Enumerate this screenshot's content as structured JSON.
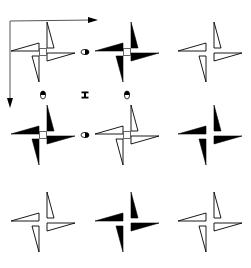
{
  "diagram": {
    "type": "symmetry-pattern",
    "colors": {
      "ink": "#000000",
      "background": "#ffffff",
      "axis": "#555555"
    },
    "axes": {
      "origin": [
        10,
        21
      ],
      "x_end": [
        98,
        20
      ],
      "y_end": [
        10,
        108
      ]
    },
    "pinwheels": [
      {
        "row": 0,
        "col": 0,
        "cx": 43,
        "cy": 52,
        "style": "outline",
        "center_square": true
      },
      {
        "row": 0,
        "col": 1,
        "cx": 127,
        "cy": 52,
        "style": "filled",
        "center_square": true
      },
      {
        "row": 0,
        "col": 2,
        "cx": 210,
        "cy": 52,
        "style": "outline",
        "center_square": false
      },
      {
        "row": 1,
        "col": 0,
        "cx": 43,
        "cy": 135,
        "style": "filled",
        "center_square": true
      },
      {
        "row": 1,
        "col": 1,
        "cx": 127,
        "cy": 135,
        "style": "outline",
        "center_square": true
      },
      {
        "row": 1,
        "col": 2,
        "cx": 210,
        "cy": 135,
        "style": "filled",
        "center_square": false
      },
      {
        "row": 2,
        "col": 0,
        "cx": 43,
        "cy": 222,
        "style": "outline",
        "center_square": false
      },
      {
        "row": 2,
        "col": 1,
        "cx": 127,
        "cy": 222,
        "style": "filled",
        "center_square": false
      },
      {
        "row": 2,
        "col": 2,
        "cx": 210,
        "cy": 222,
        "style": "outline",
        "center_square": false
      }
    ],
    "twofold_markers": [
      {
        "x": 85,
        "y": 52,
        "orientation": "horizontal"
      },
      {
        "x": 43,
        "y": 95,
        "orientation": "vertical"
      },
      {
        "x": 127,
        "y": 95,
        "orientation": "vertical"
      },
      {
        "x": 85,
        "y": 135,
        "orientation": "horizontal"
      }
    ],
    "center_marker": {
      "x": 85,
      "y": 95,
      "symbol": "I-beam"
    },
    "icons": {
      "fourfold_center": "small-square-icon",
      "twofold_center": "half-filled-oval-icon",
      "axis_arrow": "arrow-icon"
    }
  }
}
